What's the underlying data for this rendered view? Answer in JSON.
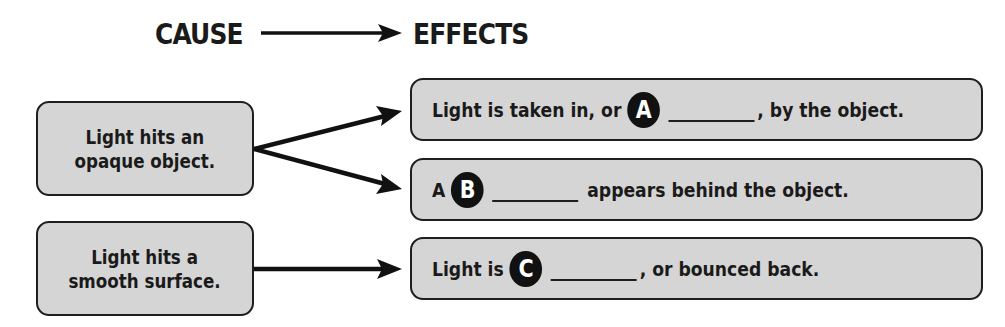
{
  "header": {
    "cause": "CAUSE",
    "effects": "EFFECTS"
  },
  "causes": [
    {
      "line1": "Light hits an",
      "line2": "opaque object."
    },
    {
      "line1": "Light hits a",
      "line2": "smooth surface."
    }
  ],
  "effects": [
    {
      "before": "Light is taken in, or",
      "badge": "A",
      "after": ", by the object."
    },
    {
      "before": "A",
      "badge": "B",
      "after": "appears behind the object."
    },
    {
      "before": "Light is",
      "badge": "C",
      "after": ", or bounced back."
    }
  ],
  "links": [
    {
      "from": "causes.0",
      "to": "effects.0"
    },
    {
      "from": "causes.0",
      "to": "effects.1"
    },
    {
      "from": "causes.1",
      "to": "effects.2"
    }
  ],
  "colors": {
    "box_fill": "#d5d5d5",
    "border": "#1e1e1e",
    "text": "#1a1a1a",
    "badge_fill": "#111111",
    "badge_text": "#ffffff"
  }
}
